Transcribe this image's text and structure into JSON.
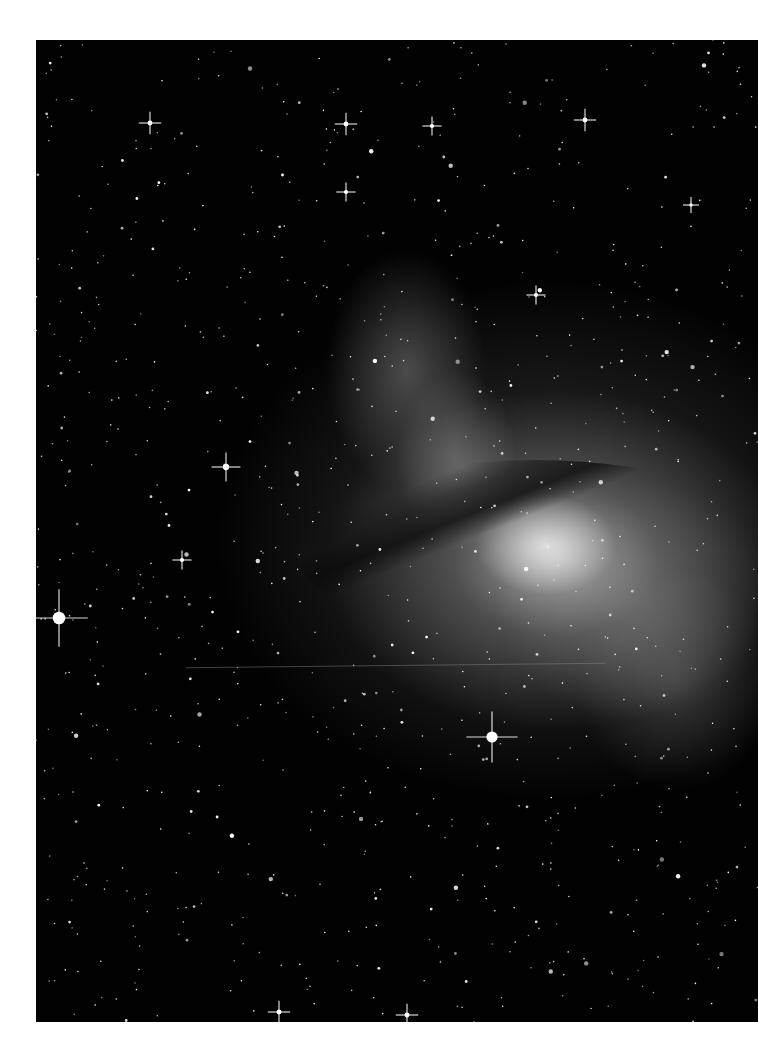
{
  "image": {
    "subject": "Centaurus A galaxy with stellar field",
    "type": "astronomical photograph (grayscale)",
    "colors": {
      "page_background": "#ffffff",
      "sky": "#020202",
      "star": "#ffffff",
      "nebula_glow": "#c8c8c8"
    }
  }
}
